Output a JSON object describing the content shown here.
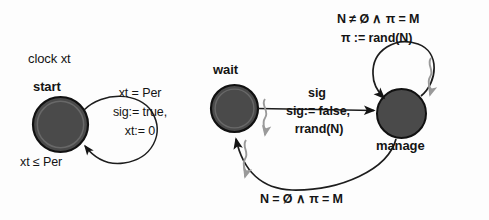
{
  "figure": {
    "kind": "timed-automaton-diagram",
    "background_color": "#fdfdfd",
    "ink_color": "#141414",
    "node_fill_color": "#4a4a4a",
    "node_stroke_color": "#1a1a1a",
    "squiggle_color": "#9a9a9a"
  },
  "declarations": {
    "clock": "clock xt"
  },
  "left_automaton": {
    "state": {
      "name": "start",
      "invariant": "xt ≤ Per"
    },
    "self_loop": {
      "guard": "xt = Per",
      "action_line1": "sig:= true,",
      "action_line2": "xt:= 0"
    }
  },
  "right_automaton": {
    "states": [
      {
        "name": "wait"
      },
      {
        "name": "manage"
      }
    ],
    "transitions": [
      {
        "from": "wait",
        "to": "manage",
        "guard": "sig",
        "action_line1": "sig:= false,",
        "action_line2": "rrand(N)"
      },
      {
        "from": "manage",
        "to": "manage",
        "guard": "N ≠ Ø ∧ π = M",
        "action_line1": "π := rand(N)"
      },
      {
        "from": "manage",
        "to": "wait",
        "guard": "N = Ø ∧ π = M"
      }
    ]
  }
}
